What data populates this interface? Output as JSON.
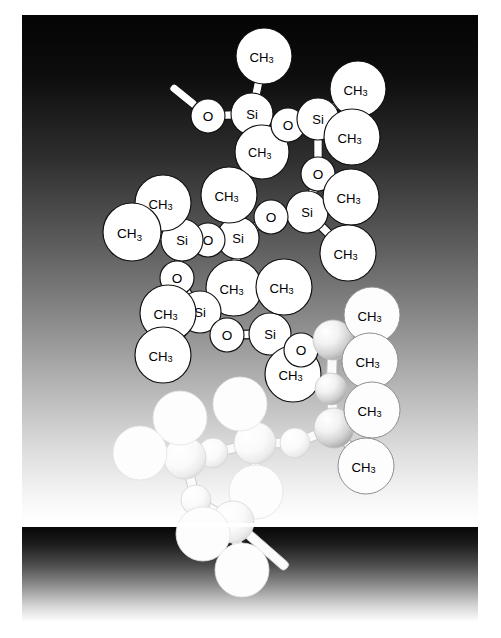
{
  "figure": {
    "panels": [
      {
        "name": "main-panel",
        "x": 22,
        "y": 15,
        "width": 456,
        "height": 508,
        "gradient_top": "#050505",
        "gradient_bottom": "#ffffff"
      },
      {
        "name": "bottom-band",
        "x": 22,
        "y": 527,
        "width": 456,
        "height": 95,
        "gradient_top": "#090909",
        "gradient_bottom": "#ffffff"
      }
    ],
    "background_color": "#ffffff"
  },
  "style": {
    "atom_fill": "#ffffff",
    "atom_stroke": "#111111",
    "bond_fill": "#ffffff",
    "bond_stroke": "#111111",
    "label_color": "#000000",
    "ghost_fill_light": "#fbfbfb",
    "ghost_fill_mid": "#e8e8e8",
    "ghost_shadow": "#9a9a9a"
  },
  "labels": {
    "silicon": "Si",
    "oxygen": "O",
    "methyl_main": "CH",
    "methyl_sub": "3"
  },
  "molecule": {
    "formula_unit": "Si-O",
    "repeat_label": "CH3",
    "atoms": [
      {
        "id": "o1",
        "element": "O",
        "label": "O",
        "x": 208,
        "y": 116,
        "r": 17,
        "style": "crisp"
      },
      {
        "id": "si1",
        "element": "Si",
        "label": "Si",
        "x": 252,
        "y": 114,
        "r": 21,
        "style": "crisp"
      },
      {
        "id": "c1",
        "element": "CH3",
        "label": "CH3",
        "x": 264,
        "y": 56,
        "r": 28,
        "style": "crisp"
      },
      {
        "id": "c2",
        "element": "CH3",
        "label": "CH3",
        "x": 262,
        "y": 152,
        "r": 27,
        "style": "crisp"
      },
      {
        "id": "o2",
        "element": "O",
        "label": "O",
        "x": 288,
        "y": 125,
        "r": 17,
        "style": "crisp"
      },
      {
        "id": "si2",
        "element": "Si",
        "label": "Si",
        "x": 318,
        "y": 119,
        "r": 21,
        "style": "crisp"
      },
      {
        "id": "c3",
        "element": "CH3",
        "label": "CH3",
        "x": 358,
        "y": 89,
        "r": 28,
        "style": "crisp"
      },
      {
        "id": "c4",
        "element": "CH3",
        "label": "CH3",
        "x": 352,
        "y": 137,
        "r": 28,
        "style": "crisp"
      },
      {
        "id": "o3",
        "element": "O",
        "label": "O",
        "x": 318,
        "y": 174,
        "r": 17,
        "style": "crisp"
      },
      {
        "id": "si3",
        "element": "Si",
        "label": "Si",
        "x": 307,
        "y": 212,
        "r": 21,
        "style": "crisp"
      },
      {
        "id": "c5",
        "element": "CH3",
        "label": "CH3",
        "x": 351,
        "y": 197,
        "r": 28,
        "style": "crisp"
      },
      {
        "id": "c6",
        "element": "CH3",
        "label": "CH3",
        "x": 348,
        "y": 253,
        "r": 28,
        "style": "crisp"
      },
      {
        "id": "o4",
        "element": "O",
        "label": "O",
        "x": 271,
        "y": 217,
        "r": 17,
        "style": "crisp"
      },
      {
        "id": "si4",
        "element": "Si",
        "label": "Si",
        "x": 238,
        "y": 238,
        "r": 21,
        "style": "crisp"
      },
      {
        "id": "c7",
        "element": "CH3",
        "label": "CH3",
        "x": 229,
        "y": 195,
        "r": 28,
        "style": "crisp"
      },
      {
        "id": "c8",
        "element": "CH3",
        "label": "CH3",
        "x": 234,
        "y": 288,
        "r": 28,
        "style": "crisp"
      },
      {
        "id": "o5",
        "element": "O",
        "label": "O",
        "x": 208,
        "y": 240,
        "r": 17,
        "style": "crisp"
      },
      {
        "id": "si5",
        "element": "Si",
        "label": "Si",
        "x": 182,
        "y": 240,
        "r": 21,
        "style": "crisp"
      },
      {
        "id": "c9",
        "element": "CH3",
        "label": "CH3",
        "x": 163,
        "y": 203,
        "r": 28,
        "style": "crisp"
      },
      {
        "id": "c10",
        "element": "CH3",
        "label": "CH3",
        "x": 132,
        "y": 232,
        "r": 29,
        "style": "crisp"
      },
      {
        "id": "o6",
        "element": "O",
        "label": "O",
        "x": 177,
        "y": 278,
        "r": 17,
        "style": "crisp"
      },
      {
        "id": "si6",
        "element": "Si",
        "label": "Si",
        "x": 200,
        "y": 312,
        "r": 21,
        "style": "crisp"
      },
      {
        "id": "c11",
        "element": "CH3",
        "label": "CH3",
        "x": 168,
        "y": 313,
        "r": 28,
        "style": "crisp"
      },
      {
        "id": "c12",
        "element": "CH3",
        "label": "CH3",
        "x": 163,
        "y": 355,
        "r": 28,
        "style": "crisp"
      },
      {
        "id": "o7",
        "element": "O",
        "label": "O",
        "x": 227,
        "y": 335,
        "r": 17,
        "style": "crisp"
      },
      {
        "id": "si7",
        "element": "Si",
        "label": "Si",
        "x": 270,
        "y": 334,
        "r": 21,
        "style": "crisp"
      },
      {
        "id": "c13",
        "element": "CH3",
        "label": "CH3",
        "x": 284,
        "y": 287,
        "r": 28,
        "style": "crisp"
      },
      {
        "id": "c14",
        "element": "CH3",
        "label": "CH3",
        "x": 293,
        "y": 374,
        "r": 28,
        "style": "crisp"
      },
      {
        "id": "o8",
        "element": "O",
        "label": "O",
        "x": 301,
        "y": 350,
        "r": 17,
        "style": "crisp"
      },
      {
        "id": "si8",
        "element": "Si",
        "label": "",
        "x": 333,
        "y": 340,
        "r": 20,
        "style": "ghost-strong"
      },
      {
        "id": "c15",
        "element": "CH3",
        "label": "CH3",
        "x": 372,
        "y": 315,
        "r": 28,
        "style": "faint"
      },
      {
        "id": "c16",
        "element": "CH3",
        "label": "CH3",
        "x": 370,
        "y": 361,
        "r": 28,
        "style": "faint"
      },
      {
        "id": "o9",
        "element": "O",
        "label": "",
        "x": 331,
        "y": 389,
        "r": 16,
        "style": "ghost-strong"
      },
      {
        "id": "si9",
        "element": "Si",
        "label": "",
        "x": 334,
        "y": 428,
        "r": 20,
        "style": "ghost-strong"
      },
      {
        "id": "c17",
        "element": "CH3",
        "label": "CH3",
        "x": 372,
        "y": 410,
        "r": 28,
        "style": "faint"
      },
      {
        "id": "c18",
        "element": "CH3",
        "label": "CH3",
        "x": 366,
        "y": 466,
        "r": 28,
        "style": "faint"
      },
      {
        "id": "o10",
        "element": "O",
        "label": "",
        "x": 295,
        "y": 443,
        "r": 15,
        "style": "ghost-mid"
      },
      {
        "id": "si10",
        "element": "Si",
        "label": "",
        "x": 255,
        "y": 443,
        "r": 21,
        "style": "ghost-mid"
      },
      {
        "id": "c19",
        "element": "CH3",
        "label": "",
        "x": 240,
        "y": 404,
        "r": 27,
        "style": "ghost-faint"
      },
      {
        "id": "c20",
        "element": "CH3",
        "label": "",
        "x": 256,
        "y": 492,
        "r": 27,
        "style": "ghost-faint"
      },
      {
        "id": "o11",
        "element": "O",
        "label": "",
        "x": 213,
        "y": 453,
        "r": 15,
        "style": "ghost-mid"
      },
      {
        "id": "si11",
        "element": "Si",
        "label": "",
        "x": 185,
        "y": 458,
        "r": 21,
        "style": "ghost-mid"
      },
      {
        "id": "c21",
        "element": "CH3",
        "label": "",
        "x": 180,
        "y": 418,
        "r": 27,
        "style": "ghost-faint"
      },
      {
        "id": "c22",
        "element": "CH3",
        "label": "",
        "x": 140,
        "y": 453,
        "r": 27,
        "style": "ghost-faint"
      },
      {
        "id": "o12",
        "element": "O",
        "label": "",
        "x": 196,
        "y": 500,
        "r": 15,
        "style": "ghost-mid"
      },
      {
        "id": "si12",
        "element": "Si",
        "label": "",
        "x": 233,
        "y": 522,
        "r": 21,
        "style": "ghost-mid"
      },
      {
        "id": "c23",
        "element": "CH3",
        "label": "",
        "x": 203,
        "y": 534,
        "r": 27,
        "style": "ghost-faint"
      },
      {
        "id": "c24",
        "element": "CH3",
        "label": "",
        "x": 242,
        "y": 570,
        "r": 27,
        "style": "ghost-faint"
      }
    ],
    "bonds": [
      {
        "from": "o1",
        "to": "si1",
        "style": "crisp"
      },
      {
        "from": "si1",
        "to": "c1",
        "style": "crisp"
      },
      {
        "from": "si1",
        "to": "c2",
        "style": "crisp"
      },
      {
        "from": "si1",
        "to": "o2",
        "style": "crisp"
      },
      {
        "from": "o2",
        "to": "si2",
        "style": "crisp"
      },
      {
        "from": "si2",
        "to": "c3",
        "style": "crisp"
      },
      {
        "from": "si2",
        "to": "c4",
        "style": "crisp"
      },
      {
        "from": "si2",
        "to": "o3",
        "style": "crisp"
      },
      {
        "from": "o3",
        "to": "si3",
        "style": "crisp"
      },
      {
        "from": "si3",
        "to": "c5",
        "style": "crisp"
      },
      {
        "from": "si3",
        "to": "c6",
        "style": "crisp"
      },
      {
        "from": "si3",
        "to": "o4",
        "style": "crisp"
      },
      {
        "from": "o4",
        "to": "si4",
        "style": "crisp"
      },
      {
        "from": "si4",
        "to": "c7",
        "style": "crisp"
      },
      {
        "from": "si4",
        "to": "c8",
        "style": "crisp"
      },
      {
        "from": "si4",
        "to": "o5",
        "style": "crisp"
      },
      {
        "from": "o5",
        "to": "si5",
        "style": "crisp"
      },
      {
        "from": "si5",
        "to": "c9",
        "style": "crisp"
      },
      {
        "from": "si5",
        "to": "c10",
        "style": "crisp"
      },
      {
        "from": "si5",
        "to": "o6",
        "style": "crisp"
      },
      {
        "from": "o6",
        "to": "si6",
        "style": "crisp"
      },
      {
        "from": "si6",
        "to": "c11",
        "style": "crisp"
      },
      {
        "from": "si6",
        "to": "c12",
        "style": "crisp"
      },
      {
        "from": "si6",
        "to": "o7",
        "style": "crisp"
      },
      {
        "from": "o7",
        "to": "si7",
        "style": "crisp"
      },
      {
        "from": "si7",
        "to": "c13",
        "style": "crisp"
      },
      {
        "from": "si7",
        "to": "c14",
        "style": "crisp"
      },
      {
        "from": "si7",
        "to": "o8",
        "style": "crisp"
      },
      {
        "from": "o8",
        "to": "si8",
        "style": "ghost"
      },
      {
        "from": "si8",
        "to": "c15",
        "style": "faint"
      },
      {
        "from": "si8",
        "to": "c16",
        "style": "faint"
      },
      {
        "from": "si8",
        "to": "o9",
        "style": "ghost"
      },
      {
        "from": "o9",
        "to": "si9",
        "style": "ghost"
      },
      {
        "from": "si9",
        "to": "c17",
        "style": "faint"
      },
      {
        "from": "si9",
        "to": "c18",
        "style": "faint"
      },
      {
        "from": "si9",
        "to": "o10",
        "style": "ghost"
      },
      {
        "from": "o10",
        "to": "si10",
        "style": "ghost"
      },
      {
        "from": "si10",
        "to": "c19",
        "style": "ghost"
      },
      {
        "from": "si10",
        "to": "c20",
        "style": "ghost"
      },
      {
        "from": "si10",
        "to": "o11",
        "style": "ghost"
      },
      {
        "from": "o11",
        "to": "si11",
        "style": "ghost"
      },
      {
        "from": "si11",
        "to": "c21",
        "style": "ghost"
      },
      {
        "from": "si11",
        "to": "c22",
        "style": "ghost"
      },
      {
        "from": "si11",
        "to": "o12",
        "style": "ghost"
      },
      {
        "from": "o12",
        "to": "si12",
        "style": "ghost"
      },
      {
        "from": "si12",
        "to": "c23",
        "style": "ghost"
      },
      {
        "from": "si12",
        "to": "c24",
        "style": "ghost"
      }
    ],
    "open_bonds": [
      {
        "name": "chain-continuation-stub",
        "x1": 196,
        "y1": 106,
        "x2": 171,
        "y2": 86,
        "style": "crisp"
      },
      {
        "name": "chain-continuation-stub-bottom",
        "x1": 247,
        "y1": 533,
        "x2": 287,
        "y2": 568,
        "style": "ghost"
      }
    ]
  }
}
